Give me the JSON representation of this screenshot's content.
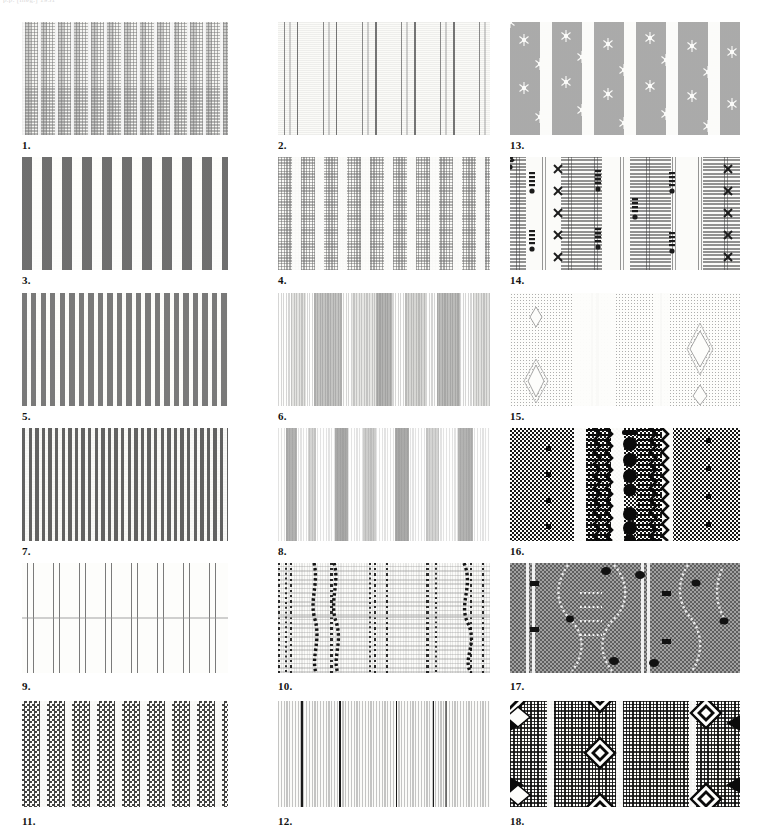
{
  "page": {
    "header_note": "p.p. [illeg.] 1931",
    "background": "#ffffff",
    "width": 784,
    "height": 830
  },
  "plate": {
    "columns": 3,
    "rows": 6,
    "order": "column-major",
    "swatches": [
      {
        "number": "1.",
        "column": 1,
        "row": 1,
        "texture": "t1",
        "description": "woven check-on-stripe, light gray on cream vertical bands",
        "dominant_colors": [
          "#f4f4f1",
          "#8e8e8e"
        ]
      },
      {
        "number": "3.",
        "column": 1,
        "row": 2,
        "texture": "t3",
        "description": "bold wide alternating dark gray and white vertical stripes",
        "dominant_colors": [
          "#fcfcfa",
          "#676767"
        ]
      },
      {
        "number": "5.",
        "column": 1,
        "row": 3,
        "texture": "t5",
        "description": "dense medium-dark even vertical stripes",
        "dominant_colors": [
          "#fbfbf9",
          "#6e6e6e"
        ]
      },
      {
        "number": "7.",
        "column": 1,
        "row": 4,
        "texture": "t7",
        "description": "very fine dense dark vertical stripes, full coverage",
        "dominant_colors": [
          "#f6f6f3",
          "#555555"
        ]
      },
      {
        "number": "9.",
        "column": 1,
        "row": 5,
        "texture": "t9",
        "description": "thin double stripe pairs on white ground with horizontal crease",
        "dominant_colors": [
          "#fdfdfb",
          "#5a5a5a"
        ]
      },
      {
        "number": "11.",
        "column": 1,
        "row": 6,
        "texture": "t11",
        "description": "checkerboard-textured wide bands separated by white stripes",
        "dominant_colors": [
          "#fbfbf9",
          "#282828"
        ]
      },
      {
        "number": "2.",
        "column": 2,
        "row": 1,
        "texture": "t2",
        "description": "sparse vertical stripe groups on near-white ground",
        "dominant_colors": [
          "#fbfbf8",
          "#5f5f5f"
        ]
      },
      {
        "number": "4.",
        "column": 2,
        "row": 2,
        "texture": "t4",
        "description": "narrow dotted woven columns with wide white gaps",
        "dominant_colors": [
          "#fafaf7",
          "#6e6e6e"
        ]
      },
      {
        "number": "6.",
        "column": 2,
        "row": 3,
        "texture": "t6",
        "description": "graded stripe bands, light and medium gray with darker accents",
        "dominant_colors": [
          "#fafaf7",
          "#4b4b4b"
        ]
      },
      {
        "number": "8.",
        "column": 2,
        "row": 4,
        "texture": "t8",
        "description": "medium stripe clusters on pale ground",
        "dominant_colors": [
          "#fbfbf9",
          "#5f5f5f"
        ]
      },
      {
        "number": "10.",
        "column": 2,
        "row": 5,
        "texture": "t10",
        "description": "wavy beaded ikat-like columns on fine striped ground with crease",
        "dominant_colors": [
          "#fbfbf9",
          "#191919"
        ]
      },
      {
        "number": "12.",
        "column": 2,
        "row": 6,
        "texture": "t12",
        "description": "fine dense light stripes with black accent lines",
        "dominant_colors": [
          "#fbfbf9",
          "#0f0f0f"
        ]
      },
      {
        "number": "13.",
        "column": 3,
        "row": 1,
        "texture": "t13",
        "description": "gray vertical bands with small white sprig and star motifs",
        "dominant_colors": [
          "#fbfbf9",
          "#969696"
        ]
      },
      {
        "number": "14.",
        "column": 3,
        "row": 2,
        "texture": "t14",
        "description": "fine striped ribbons with X crosses and stacked dot motifs",
        "dominant_colors": [
          "#fbfbf9",
          "#3c3c3c"
        ]
      },
      {
        "number": "15.",
        "column": 3,
        "row": 3,
        "texture": "t15",
        "description": "pale dotted ground with lozenge motifs and dark stripe pairs",
        "dominant_colors": [
          "#fdfdfb",
          "#5f5f5f"
        ]
      },
      {
        "number": "16.",
        "column": 3,
        "row": 4,
        "texture": "t16",
        "description": "high contrast zigzag stripes, large dots and checkered columns",
        "dominant_colors": [
          "#fdfdfb",
          "#0a0a0a"
        ]
      },
      {
        "number": "17.",
        "column": 3,
        "row": 5,
        "texture": "t17",
        "description": "dark gray woven ground with light vine trails and dark nubs",
        "dominant_colors": [
          "#8b8b8b",
          "#fafafa"
        ]
      },
      {
        "number": "18.",
        "column": 3,
        "row": 6,
        "texture": "t18",
        "description": "dense dotted ground with white-outlined diamond motifs",
        "dominant_colors": [
          "#fdfdfb",
          "#0a0a0a"
        ]
      }
    ]
  }
}
